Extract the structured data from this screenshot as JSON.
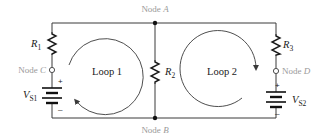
{
  "diagram": {
    "type": "two-loop circuit",
    "nodes": {
      "a": {
        "prefix": "Node ",
        "letter": "A"
      },
      "b": {
        "prefix": "Node ",
        "letter": "B"
      },
      "c": {
        "prefix": "Node ",
        "letter": "C"
      },
      "d": {
        "prefix": "Node ",
        "letter": "D"
      }
    },
    "resistors": [
      {
        "id": "R1",
        "symbol": "R",
        "sub": "1"
      },
      {
        "id": "R2",
        "symbol": "R",
        "sub": "2"
      },
      {
        "id": "R3",
        "symbol": "R",
        "sub": "3"
      }
    ],
    "sources": [
      {
        "id": "VS1",
        "symbol": "V",
        "sub": "S1",
        "plus": "+",
        "minus": "–"
      },
      {
        "id": "VS2",
        "symbol": "V",
        "sub": "S2",
        "plus": "+",
        "minus": "–"
      }
    ],
    "loops": [
      {
        "label": "Loop 1",
        "direction": "clockwise"
      },
      {
        "label": "Loop 2",
        "direction": "clockwise"
      }
    ],
    "colors": {
      "wire": "#3a3a3a",
      "node_label": "#9a9a9a",
      "text": "#1a1a1a"
    }
  }
}
